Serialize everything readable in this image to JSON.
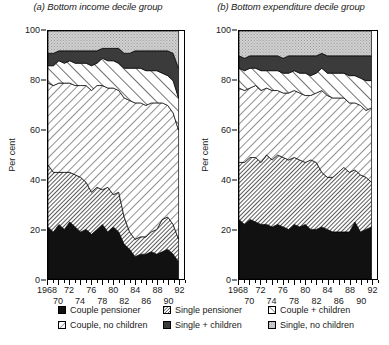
{
  "figure": {
    "ylabel": "Per cent"
  },
  "panels": [
    {
      "title": "(a) Bottom income decile group"
    },
    {
      "title": "(b) Bottom expenditure decile group"
    }
  ],
  "axes": {
    "yticks": [
      0,
      20,
      40,
      60,
      80,
      100
    ],
    "ylim": [
      0,
      100
    ],
    "xlim": [
      1968,
      1993
    ],
    "xtick_row1": [
      "1968",
      "72",
      "76",
      "80",
      "84",
      "88",
      "92"
    ],
    "xtick_row1_years": [
      1968,
      1972,
      1976,
      1980,
      1984,
      1988,
      1992
    ],
    "xtick_row2": [
      "70",
      "74",
      "78",
      "82",
      "86",
      "90"
    ],
    "xtick_row2_years": [
      1970,
      1974,
      1978,
      1982,
      1986,
      1990
    ]
  },
  "legend": {
    "items": [
      {
        "label": "Couple pensioner",
        "pattern": "solid-black",
        "color": "#1a1a1a"
      },
      {
        "label": "Single pensioner",
        "pattern": "hatch-fine-45",
        "color": "#d8d8d8"
      },
      {
        "label": "Couple + children",
        "pattern": "stripe-bold-45",
        "color": "#ffffff"
      },
      {
        "label": "Couple, no children",
        "pattern": "hatch-light-45",
        "color": "#ffffff"
      },
      {
        "label": "Single + children",
        "pattern": "solid-dark",
        "color": "#3a3a3a"
      },
      {
        "label": "Single, no children",
        "pattern": "stipple-light",
        "color": "#cccccc"
      }
    ]
  },
  "chart_data": {
    "type": "area",
    "xlabel": "",
    "ylabel": "Per cent",
    "ylim": [
      0,
      100
    ],
    "xlim": [
      1968,
      1993
    ],
    "grid": false,
    "legend_position": "bottom",
    "stacked": true,
    "stack_order": [
      "Couple pensioner",
      "Single pensioner",
      "Couple, no children",
      "Couple + children",
      "Single + children",
      "Single, no children"
    ],
    "x": [
      1968,
      1969,
      1970,
      1971,
      1972,
      1973,
      1974,
      1975,
      1976,
      1977,
      1978,
      1979,
      1980,
      1981,
      1982,
      1983,
      1984,
      1985,
      1986,
      1987,
      1988,
      1989,
      1990,
      1991,
      1992
    ],
    "charts": [
      {
        "id": "a",
        "title": "(a) Bottom income decile group",
        "series": [
          {
            "name": "Couple pensioner",
            "values": [
              21,
              19,
              22,
              20,
              23,
              21,
              19,
              20,
              18,
              20,
              22,
              19,
              21,
              19,
              14,
              12,
              9,
              10,
              10,
              11,
              10,
              11,
              12,
              10,
              7
            ]
          },
          {
            "name": "Single pensioner",
            "values": [
              25,
              24,
              21,
              23,
              20,
              21,
              22,
              19,
              17,
              17,
              14,
              18,
              13,
              16,
              11,
              7,
              7,
              7,
              7,
              8,
              10,
              13,
              13,
              12,
              9
            ]
          },
          {
            "name": "Couple, no children",
            "values": [
              33,
              35,
              36,
              36,
              36,
              36,
              37,
              39,
              41,
              41,
              42,
              40,
              43,
              41,
              48,
              53,
              55,
              54,
              53,
              52,
              51,
              47,
              45,
              45,
              44
            ]
          },
          {
            "name": "Couple + children",
            "values": [
              7,
              8,
              9,
              8,
              9,
              9,
              9,
              9,
              10,
              9,
              11,
              11,
              11,
              11,
              12,
              13,
              14,
              14,
              14,
              13,
              13,
              12,
              12,
              13,
              13
            ]
          },
          {
            "name": "Single + children",
            "values": [
              5,
              5,
              4,
              5,
              4,
              5,
              5,
              5,
              6,
              5,
              4,
              5,
              5,
              6,
              6,
              6,
              7,
              7,
              8,
              8,
              8,
              9,
              10,
              11,
              12
            ]
          },
          {
            "name": "Single, no children",
            "values": [
              9,
              9,
              8,
              8,
              8,
              8,
              8,
              8,
              8,
              8,
              7,
              7,
              7,
              7,
              9,
              9,
              8,
              8,
              8,
              8,
              8,
              8,
              8,
              9,
              15
            ]
          }
        ]
      },
      {
        "id": "b",
        "title": "(b) Bottom expenditure decile group",
        "series": [
          {
            "name": "Couple pensioner",
            "values": [
              24,
              22,
              24,
              23,
              22,
              22,
              21,
              22,
              21,
              20,
              22,
              21,
              22,
              20,
              20,
              21,
              20,
              19,
              19,
              19,
              19,
              23,
              19,
              20,
              21
            ]
          },
          {
            "name": "Single pensioner",
            "values": [
              23,
              25,
              25,
              26,
              25,
              28,
              27,
              28,
              28,
              28,
              27,
              27,
              25,
              28,
              27,
              22,
              21,
              22,
              24,
              26,
              24,
              21,
              23,
              21,
              18
            ]
          },
          {
            "name": "Couple, no children",
            "values": [
              30,
              29,
              28,
              29,
              29,
              27,
              28,
              26,
              26,
              27,
              27,
              27,
              27,
              26,
              28,
              33,
              33,
              32,
              30,
              28,
              28,
              27,
              28,
              27,
              30
            ]
          },
          {
            "name": "Couple + children",
            "values": [
              8,
              8,
              8,
              7,
              8,
              7,
              8,
              8,
              8,
              8,
              8,
              8,
              9,
              8,
              8,
              9,
              9,
              10,
              10,
              10,
              11,
              11,
              11,
              12,
              11
            ]
          },
          {
            "name": "Single + children",
            "values": [
              5,
              5,
              5,
              5,
              6,
              6,
              6,
              6,
              6,
              7,
              6,
              7,
              7,
              8,
              7,
              6,
              7,
              7,
              7,
              7,
              8,
              8,
              9,
              10,
              10
            ]
          },
          {
            "name": "Single, no children",
            "values": [
              10,
              11,
              10,
              10,
              10,
              10,
              10,
              10,
              11,
              10,
              10,
              10,
              10,
              10,
              10,
              9,
              10,
              10,
              10,
              10,
              10,
              10,
              10,
              10,
              10
            ]
          }
        ]
      }
    ]
  }
}
